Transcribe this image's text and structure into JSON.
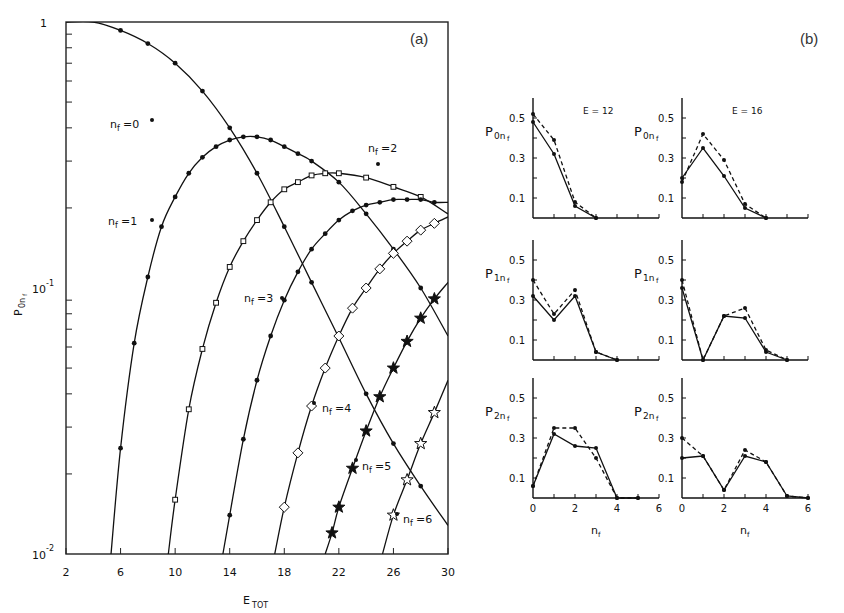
{
  "panel_labels": {
    "a": "(a)",
    "b": "(b)"
  },
  "chart_data": [
    {
      "type": "line",
      "panel": "(a)",
      "title": "",
      "xlabel": "E_TOT",
      "ylabel": "P_0nf",
      "xscale": "linear",
      "yscale": "log",
      "xlim": [
        2,
        30
      ],
      "ylim": [
        0.01,
        1
      ],
      "xticks": [
        2,
        6,
        10,
        14,
        18,
        22,
        26,
        30
      ],
      "ytick_labels": [
        "1",
        "10^-1",
        "10^-2"
      ],
      "grid": false,
      "series": [
        {
          "name": "n_f=0",
          "marker": "dot",
          "x": [
            2,
            4,
            6,
            8,
            10,
            12,
            14,
            16,
            18,
            20,
            22,
            24,
            26,
            28,
            30
          ],
          "y": [
            1.0,
            1.0,
            0.93,
            0.83,
            0.7,
            0.55,
            0.4,
            0.27,
            0.17,
            0.105,
            0.065,
            0.04,
            0.026,
            0.018,
            0.0128
          ]
        },
        {
          "name": "n_f=1",
          "marker": "dot",
          "x": [
            5.3,
            6,
            7,
            8,
            9,
            10,
            11,
            12,
            13,
            14,
            15,
            16,
            17,
            18,
            19,
            20,
            22,
            24,
            26,
            28,
            30
          ],
          "y": [
            0.01,
            0.025,
            0.062,
            0.11,
            0.17,
            0.22,
            0.27,
            0.31,
            0.34,
            0.36,
            0.37,
            0.37,
            0.36,
            0.34,
            0.32,
            0.3,
            0.25,
            0.19,
            0.14,
            0.1,
            0.066
          ]
        },
        {
          "name": "n_f=2",
          "marker": "square",
          "x": [
            9.5,
            10,
            11,
            12,
            13,
            14,
            15,
            16,
            17,
            18,
            19,
            20,
            21,
            22,
            24,
            26,
            28,
            30
          ],
          "y": [
            0.01,
            0.016,
            0.035,
            0.059,
            0.088,
            0.12,
            0.15,
            0.18,
            0.21,
            0.235,
            0.25,
            0.265,
            0.27,
            0.27,
            0.26,
            0.24,
            0.22,
            0.19
          ]
        },
        {
          "name": "n_f=3",
          "marker": "dot",
          "x": [
            13.5,
            14,
            15,
            16,
            17,
            18,
            19,
            20,
            21,
            22,
            23,
            24,
            25,
            26,
            27,
            28,
            29,
            30
          ],
          "y": [
            0.01,
            0.014,
            0.027,
            0.045,
            0.066,
            0.09,
            0.115,
            0.14,
            0.16,
            0.18,
            0.195,
            0.205,
            0.21,
            0.215,
            0.215,
            0.215,
            0.21,
            0.21
          ]
        },
        {
          "name": "n_f=4",
          "marker": "diamond",
          "x": [
            17.3,
            18,
            19,
            20,
            21,
            22,
            23,
            24,
            25,
            26,
            27,
            28,
            29,
            30
          ],
          "y": [
            0.01,
            0.015,
            0.024,
            0.036,
            0.05,
            0.066,
            0.084,
            0.1,
            0.118,
            0.135,
            0.15,
            0.165,
            0.175,
            0.185
          ]
        },
        {
          "name": "n_f=5",
          "marker": "star",
          "x": [
            21,
            21.5,
            22,
            23,
            24,
            25,
            26,
            27,
            28,
            29,
            30
          ],
          "y": [
            0.01,
            0.012,
            0.015,
            0.021,
            0.029,
            0.039,
            0.05,
            0.063,
            0.077,
            0.091,
            0.105
          ]
        },
        {
          "name": "n_f=6",
          "marker": "star-open",
          "x": [
            25.2,
            26,
            27,
            28,
            29,
            30
          ],
          "y": [
            0.01,
            0.014,
            0.019,
            0.026,
            0.034,
            0.045
          ]
        }
      ],
      "annotations": [
        "n_f=0",
        "n_f=1",
        "n_f=2",
        "n_f=3",
        "n_f=4",
        "n_f=5",
        "n_f=6"
      ]
    },
    {
      "type": "line",
      "panel": "(b)",
      "layout": "3x2 grid",
      "xlabel": "n_f",
      "xticks": [
        0,
        2,
        4,
        6
      ],
      "yticks": [
        0.1,
        0.3,
        0.5
      ],
      "columns": [
        "E = 12",
        "E = 16"
      ],
      "subplots": [
        {
          "ylabel": "P_0nf",
          "energy": "E = 12",
          "solid": [
            0.48,
            0.32,
            0.06,
            0.0
          ],
          "dashed": [
            0.52,
            0.39,
            0.08,
            0.0
          ]
        },
        {
          "ylabel": "P_0nf",
          "energy": "E = 16",
          "solid": [
            0.2,
            0.35,
            0.21,
            0.05,
            0.0
          ],
          "dashed": [
            0.18,
            0.42,
            0.29,
            0.07,
            0.0
          ]
        },
        {
          "ylabel": "P_1nf",
          "energy": "E = 12",
          "solid": [
            0.32,
            0.2,
            0.32,
            0.04,
            0.0
          ],
          "dashed": [
            0.4,
            0.23,
            0.35,
            0.04,
            0.0
          ]
        },
        {
          "ylabel": "P_1nf",
          "energy": "E = 16",
          "solid": [
            0.36,
            0.0,
            0.22,
            0.21,
            0.04,
            0.0
          ],
          "dashed": [
            0.4,
            0.0,
            0.22,
            0.26,
            0.05,
            0.0
          ]
        },
        {
          "ylabel": "P_2nf",
          "energy": "E = 12",
          "solid": [
            0.06,
            0.32,
            0.26,
            0.25,
            0.0,
            0.0
          ],
          "dashed": [
            0.06,
            0.35,
            0.35,
            0.2,
            0.0,
            0.0
          ]
        },
        {
          "ylabel": "P_2nf",
          "energy": "E = 16",
          "solid": [
            0.2,
            0.21,
            0.04,
            0.21,
            0.18,
            0.01,
            0.0
          ],
          "dashed": [
            0.3,
            0.21,
            0.04,
            0.24,
            0.18,
            0.01,
            0.0
          ]
        }
      ]
    }
  ],
  "axes_a": {
    "xlabel": "E",
    "xlabel_sub": "TOT",
    "ylabel": "P",
    "ylabel_sub": "0n",
    "ylabel_subsub": "f",
    "ytick_1": "1",
    "ytick_m1": "10",
    "ytick_m1_exp": "-1",
    "ytick_m2": "10",
    "ytick_m2_exp": "-2"
  },
  "axes_b": {
    "xlabel": "n",
    "xlabel_sub": "f"
  }
}
